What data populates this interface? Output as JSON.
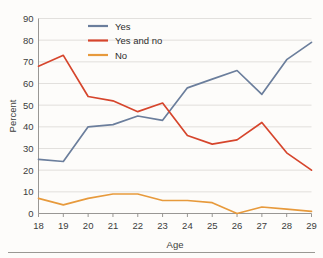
{
  "chart_data": {
    "type": "line",
    "title": "",
    "xlabel": "Age",
    "ylabel": "Percent",
    "categories": [
      18,
      19,
      20,
      21,
      22,
      23,
      24,
      25,
      26,
      27,
      28,
      29
    ],
    "x": [
      18,
      19,
      20,
      21,
      22,
      23,
      24,
      25,
      26,
      27,
      28,
      29
    ],
    "xtick_labels": [
      "18",
      "19",
      "20",
      "21",
      "22",
      "23",
      "24",
      "25",
      "26",
      "27",
      "28",
      "29"
    ],
    "ytick_labels": [
      "0",
      "10",
      "20",
      "30",
      "40",
      "50",
      "60",
      "70",
      "80",
      "90"
    ],
    "yticks": [
      0,
      10,
      20,
      30,
      40,
      50,
      60,
      70,
      80,
      90
    ],
    "ylim": [
      0,
      90
    ],
    "xlim": [
      18,
      29
    ],
    "grid": "horizontal",
    "legend_position": "top-center",
    "series": [
      {
        "name": "Yes",
        "color": "#6b7e9c",
        "values": [
          25,
          24,
          40,
          41,
          45,
          43,
          58,
          62,
          66,
          55,
          71,
          79
        ]
      },
      {
        "name": "Yes and no",
        "color": "#d6452c",
        "values": [
          68,
          73,
          54,
          52,
          47,
          51,
          36,
          32,
          34,
          42,
          28,
          20
        ]
      },
      {
        "name": "No",
        "color": "#e79a3c",
        "values": [
          7,
          4,
          7,
          9,
          9,
          6,
          6,
          5,
          0,
          3,
          2,
          1
        ]
      }
    ]
  },
  "colors": {
    "background": "#fdfcfa",
    "gridline": "#d6d4d0",
    "axis": "#8d8b88",
    "text": "#3c3c3c",
    "series_yes": "#6b7e9c",
    "series_yes_and_no": "#d6452c",
    "series_no": "#e79a3c"
  }
}
